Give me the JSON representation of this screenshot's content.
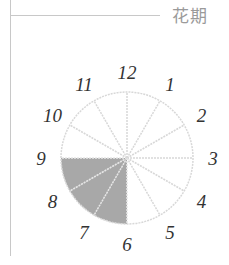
{
  "header": {
    "title": "花期"
  },
  "chart_data": {
    "type": "pie",
    "title": "花期",
    "categories": [
      "1",
      "2",
      "3",
      "4",
      "5",
      "6",
      "7",
      "8",
      "9",
      "10",
      "11",
      "12"
    ],
    "values": [
      1,
      1,
      1,
      1,
      1,
      1,
      1,
      1,
      1,
      1,
      1,
      1
    ],
    "highlighted": [
      "7",
      "8",
      "9"
    ],
    "highlight_color": "#a8a8a8",
    "outline_color": "#d8d8d8"
  },
  "labels": [
    "1",
    "2",
    "3",
    "4",
    "5",
    "6",
    "7",
    "8",
    "9",
    "10",
    "11",
    "12"
  ]
}
